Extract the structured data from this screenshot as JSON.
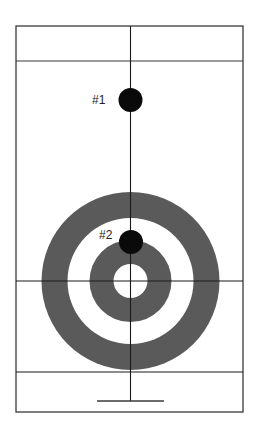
{
  "diagram": {
    "type": "curling-sheet",
    "colors": {
      "background": "#ffffff",
      "line": "#3a3a3a",
      "ring": "#5a5a5a",
      "stone": "#0a0a0a",
      "label": "#222222"
    },
    "sheet": {
      "x": 16,
      "y": 26,
      "width": 227,
      "height": 386
    },
    "lines": {
      "center_x": 130.5,
      "hog_line_y": 61,
      "tee_line_y": 281,
      "back_line_y": 372,
      "hack_line": {
        "y": 401,
        "x1": 97,
        "x2": 164
      }
    },
    "house": {
      "center": {
        "x": 130.5,
        "y": 281
      },
      "rings": [
        {
          "r": 89,
          "fill": "#5a5a5a",
          "name": "12-foot"
        },
        {
          "r": 63,
          "fill": "#ffffff",
          "name": "8-foot"
        },
        {
          "r": 41,
          "fill": "#5a5a5a",
          "name": "4-foot"
        },
        {
          "r": 17,
          "fill": "#ffffff",
          "name": "button"
        }
      ]
    },
    "stones": [
      {
        "label": "#1",
        "cx": 130.5,
        "cy": 100,
        "r": 12,
        "label_x": 92,
        "label_y": 104
      },
      {
        "label": "#2",
        "cx": 131,
        "cy": 242,
        "r": 12,
        "label_x": 99,
        "label_y": 239
      }
    ]
  }
}
